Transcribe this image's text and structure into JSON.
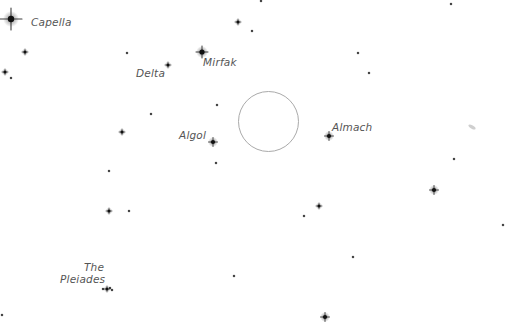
{
  "chart": {
    "background": "#ffffff",
    "star_color": "#111111",
    "circle_color": "#aaaaaa",
    "field_circle": {
      "cx": 268.5,
      "cy": 121.5,
      "r": 30
    }
  },
  "labels": [
    {
      "id": "capella",
      "text": "Capella",
      "x": 31,
      "y": 16,
      "align": "left"
    },
    {
      "id": "delta",
      "text": "Delta",
      "x": 136,
      "y": 67,
      "align": "left"
    },
    {
      "id": "mirfak",
      "text": "Mirfak",
      "x": 203,
      "y": 56,
      "align": "left"
    },
    {
      "id": "algol",
      "text": "Algol",
      "x": 179,
      "y": 129,
      "align": "left"
    },
    {
      "id": "almach",
      "text": "Almach",
      "x": 332,
      "y": 121,
      "align": "left"
    },
    {
      "id": "the",
      "text": "The",
      "x": 84,
      "y": 261,
      "align": "left"
    },
    {
      "id": "pleiades",
      "text": "Pleiades",
      "x": 60,
      "y": 273,
      "align": "left"
    }
  ],
  "stars": [
    {
      "name": "capella",
      "x": 11,
      "y": 19,
      "mag": "very-bright"
    },
    {
      "name": "star",
      "x": 25,
      "y": 52,
      "mag": "small"
    },
    {
      "name": "star",
      "x": 5,
      "y": 72,
      "mag": "small"
    },
    {
      "name": "star",
      "x": 11,
      "y": 78,
      "mag": "tiny"
    },
    {
      "name": "star",
      "x": 127,
      "y": 53,
      "mag": "tiny"
    },
    {
      "name": "delta",
      "x": 168,
      "y": 65,
      "mag": "small"
    },
    {
      "name": "star",
      "x": 261,
      "y": 1,
      "mag": "tiny"
    },
    {
      "name": "star",
      "x": 238,
      "y": 22,
      "mag": "small"
    },
    {
      "name": "star",
      "x": 252,
      "y": 31,
      "mag": "tiny"
    },
    {
      "name": "mirfak",
      "x": 202,
      "y": 52,
      "mag": "bright"
    },
    {
      "name": "star",
      "x": 358,
      "y": 53,
      "mag": "tiny"
    },
    {
      "name": "star",
      "x": 369,
      "y": 73,
      "mag": "tiny"
    },
    {
      "name": "star",
      "x": 451,
      "y": 4,
      "mag": "tiny"
    },
    {
      "name": "star",
      "x": 217,
      "y": 105,
      "mag": "tiny"
    },
    {
      "name": "star",
      "x": 151,
      "y": 114,
      "mag": "tiny"
    },
    {
      "name": "star",
      "x": 122,
      "y": 132,
      "mag": "small"
    },
    {
      "name": "algol",
      "x": 213,
      "y": 142,
      "mag": "medium"
    },
    {
      "name": "star",
      "x": 216,
      "y": 163,
      "mag": "tiny"
    },
    {
      "name": "star",
      "x": 109,
      "y": 171,
      "mag": "tiny"
    },
    {
      "name": "almach",
      "x": 329,
      "y": 136,
      "mag": "medium"
    },
    {
      "name": "star",
      "x": 454,
      "y": 159,
      "mag": "tiny"
    },
    {
      "name": "star",
      "x": 434,
      "y": 190,
      "mag": "medium"
    },
    {
      "name": "star",
      "x": 319,
      "y": 206,
      "mag": "small"
    },
    {
      "name": "star",
      "x": 304,
      "y": 216,
      "mag": "tiny"
    },
    {
      "name": "star",
      "x": 503,
      "y": 225,
      "mag": "tiny"
    },
    {
      "name": "star",
      "x": 109,
      "y": 211,
      "mag": "small"
    },
    {
      "name": "star",
      "x": 129,
      "y": 211,
      "mag": "tiny"
    },
    {
      "name": "star",
      "x": 353,
      "y": 257,
      "mag": "tiny"
    },
    {
      "name": "star",
      "x": 234,
      "y": 276,
      "mag": "tiny"
    },
    {
      "name": "star",
      "x": 325,
      "y": 317,
      "mag": "medium"
    },
    {
      "name": "star",
      "x": 2,
      "y": 315,
      "mag": "tiny"
    },
    {
      "name": "pleiades-1",
      "x": 103,
      "y": 289,
      "mag": "tiny"
    },
    {
      "name": "pleiades-2",
      "x": 107,
      "y": 289,
      "mag": "small"
    },
    {
      "name": "pleiades-3",
      "x": 110,
      "y": 288,
      "mag": "tiny"
    },
    {
      "name": "pleiades-4",
      "x": 112,
      "y": 290,
      "mag": "tiny"
    }
  ],
  "smudges": [
    {
      "x": 472,
      "y": 127
    }
  ]
}
